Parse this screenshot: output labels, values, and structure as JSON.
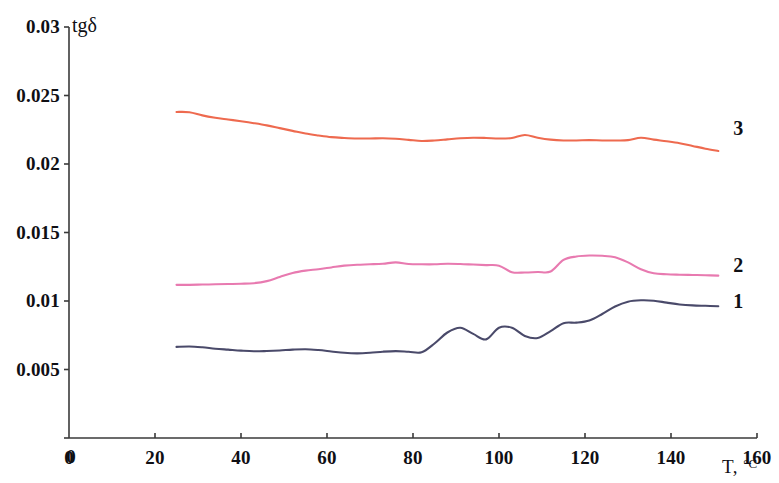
{
  "chart_data": {
    "type": "line",
    "title": "",
    "subtitle": "",
    "xlabel": "T, °C",
    "ylabel": "tgδ",
    "xlim": [
      0,
      160
    ],
    "ylim": [
      0,
      0.03
    ],
    "grid": false,
    "legend_position": "right-end-of-line",
    "xticks": [
      0,
      20,
      40,
      60,
      80,
      100,
      120,
      140,
      160
    ],
    "xtick_labels": [
      "0",
      "20",
      "40",
      "60",
      "80",
      "100",
      "120",
      "140",
      "160"
    ],
    "yticks": [
      0,
      0.005,
      0.01,
      0.015,
      0.02,
      0.025,
      0.03
    ],
    "ytick_labels": [
      "0",
      "0.005",
      "0.01",
      "0.015",
      "0.02",
      "0.025",
      "0.03"
    ],
    "annotations": [
      {
        "text": "3",
        "x": 154.5,
        "y": 0.0226,
        "series": "3"
      },
      {
        "text": "2",
        "x": 154.5,
        "y": 0.01265,
        "series": "2"
      },
      {
        "text": "1",
        "x": 154.5,
        "y": 0.01,
        "series": "1"
      }
    ],
    "series": [
      {
        "name": "1",
        "label": "1",
        "color": "#4a4a6a",
        "x": [
          25,
          28,
          31,
          34,
          37,
          40,
          43,
          46,
          49,
          52,
          55,
          58,
          61,
          64,
          67,
          70,
          73,
          76,
          79,
          82,
          85,
          88,
          91,
          94,
          97,
          100,
          103,
          106,
          109,
          112,
          115,
          118,
          121,
          124,
          127,
          130,
          133,
          136,
          139,
          142,
          145,
          148,
          151
        ],
        "y": [
          0.00665,
          0.00668,
          0.00662,
          0.00652,
          0.00645,
          0.00638,
          0.00633,
          0.00635,
          0.00639,
          0.00645,
          0.00648,
          0.00642,
          0.00632,
          0.00622,
          0.00618,
          0.00622,
          0.0063,
          0.00634,
          0.0063,
          0.00626,
          0.0069,
          0.0077,
          0.00805,
          0.0076,
          0.0072,
          0.00805,
          0.00805,
          0.00745,
          0.0073,
          0.0078,
          0.00838,
          0.00842,
          0.00858,
          0.00905,
          0.0096,
          0.00995,
          0.01005,
          0.01002,
          0.00988,
          0.00975,
          0.00968,
          0.00965,
          0.00962
        ]
      },
      {
        "name": "2",
        "label": "2",
        "color": "#e87ab0",
        "x": [
          25,
          28,
          31,
          34,
          37,
          40,
          43,
          46,
          49,
          52,
          55,
          58,
          61,
          64,
          67,
          70,
          73,
          76,
          79,
          82,
          85,
          88,
          91,
          94,
          97,
          100,
          103,
          106,
          109,
          112,
          115,
          118,
          121,
          124,
          127,
          130,
          133,
          136,
          139,
          142,
          145,
          148,
          151
        ],
        "y": [
          0.01118,
          0.01118,
          0.0112,
          0.01122,
          0.01124,
          0.01126,
          0.0113,
          0.01145,
          0.01175,
          0.01205,
          0.01222,
          0.01232,
          0.01245,
          0.01258,
          0.01265,
          0.01268,
          0.01272,
          0.01282,
          0.0127,
          0.01268,
          0.01268,
          0.01272,
          0.0127,
          0.01266,
          0.01262,
          0.01258,
          0.0121,
          0.01208,
          0.01212,
          0.01215,
          0.013,
          0.01325,
          0.01332,
          0.0133,
          0.0132,
          0.01282,
          0.01232,
          0.01202,
          0.01195,
          0.01192,
          0.0119,
          0.01188,
          0.01185
        ]
      },
      {
        "name": "3",
        "label": "3",
        "color": "#ee6a4f",
        "x": [
          25,
          28,
          31,
          34,
          37,
          40,
          43,
          46,
          49,
          52,
          55,
          58,
          61,
          64,
          67,
          70,
          73,
          76,
          79,
          82,
          85,
          88,
          91,
          94,
          97,
          100,
          103,
          106,
          109,
          112,
          115,
          118,
          121,
          124,
          127,
          130,
          133,
          136,
          139,
          142,
          145,
          148,
          151
        ],
        "y": [
          0.0238,
          0.02378,
          0.02355,
          0.02338,
          0.02325,
          0.02312,
          0.02298,
          0.02282,
          0.02262,
          0.02242,
          0.02222,
          0.02208,
          0.02196,
          0.0219,
          0.02186,
          0.02186,
          0.02188,
          0.02184,
          0.02176,
          0.02168,
          0.02172,
          0.0218,
          0.02188,
          0.02192,
          0.0219,
          0.02186,
          0.0219,
          0.02212,
          0.02192,
          0.02178,
          0.02172,
          0.02172,
          0.02174,
          0.02172,
          0.02172,
          0.02174,
          0.02192,
          0.02178,
          0.02166,
          0.02152,
          0.02132,
          0.02112,
          0.02095
        ]
      }
    ]
  },
  "axes": {
    "y_axis_name": "tgδ",
    "x_axis_name_main": "T, ",
    "x_axis_name_unit": "°C",
    "axis_color": "#3a3a3a"
  }
}
